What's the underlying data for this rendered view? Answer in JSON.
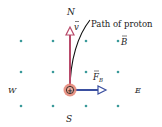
{
  "diagram": {
    "labels": {
      "north": "N",
      "south": "S",
      "west": "W",
      "east": "E",
      "path": "Path of proton",
      "velocity": "v",
      "field": "B",
      "force": "F",
      "force_sub": "B",
      "charge": "+"
    },
    "colors": {
      "dots": "#3a9a9a",
      "velocity_arrow": "#b84a6a",
      "force_arrow": "#3a4fa0",
      "proton_fill": "#e58a7a",
      "path": "#111111"
    }
  }
}
